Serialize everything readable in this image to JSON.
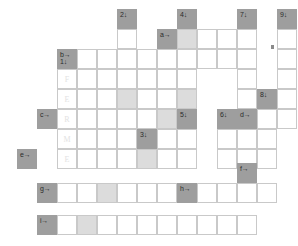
{
  "puzzle": {
    "type": "crossword-grid",
    "title": "",
    "cell_size": 20,
    "colors": {
      "clue_cell": "#9e9e9e",
      "shaded_cell": "#dcdcdc",
      "empty_cell": "#ffffff",
      "grid_line": "#c9c9c9",
      "letter_color": "#e2e2e2",
      "label_color": "#2b2b2b"
    },
    "across_markers": [
      "a→",
      "b→",
      "c→",
      "d→",
      "e→",
      "f→",
      "g→",
      "h→",
      "i→"
    ],
    "down_markers": [
      "1↓",
      "2↓",
      "3↓",
      "4↓",
      "5↓",
      "6↓",
      "7↓",
      "8↓",
      "9↓"
    ],
    "prefilled_word": "FERME",
    "cells": [
      {
        "id": "c-2d",
        "x": 117,
        "y": 9,
        "kind": "clue",
        "labels": [
          "2↓"
        ]
      },
      {
        "id": "c-4d",
        "x": 177,
        "y": 9,
        "kind": "clue",
        "labels": [
          "4↓"
        ]
      },
      {
        "id": "c-7d",
        "x": 237,
        "y": 9,
        "kind": "clue",
        "labels": [
          "7↓"
        ]
      },
      {
        "id": "c-9d",
        "x": 277,
        "y": 9,
        "kind": "clue",
        "labels": [
          "9↓"
        ]
      },
      {
        "id": "r1c2",
        "x": 117,
        "y": 29,
        "kind": "empty",
        "labels": []
      },
      {
        "id": "c-ar",
        "x": 157,
        "y": 29,
        "kind": "clue",
        "labels": [
          "a→"
        ]
      },
      {
        "id": "r1c4",
        "x": 177,
        "y": 29,
        "kind": "shade",
        "labels": []
      },
      {
        "id": "r1c5",
        "x": 197,
        "y": 29,
        "kind": "empty",
        "labels": []
      },
      {
        "id": "r1c6",
        "x": 217,
        "y": 29,
        "kind": "empty",
        "labels": []
      },
      {
        "id": "r1c7",
        "x": 237,
        "y": 29,
        "kind": "empty",
        "labels": []
      },
      {
        "id": "r1c9",
        "x": 277,
        "y": 29,
        "kind": "empty",
        "labels": []
      },
      {
        "id": "c-b1",
        "x": 57,
        "y": 49,
        "kind": "clue",
        "labels": [
          "b→",
          "1↓"
        ]
      },
      {
        "id": "r2c1",
        "x": 77,
        "y": 49,
        "kind": "empty",
        "labels": []
      },
      {
        "id": "r2c2",
        "x": 97,
        "y": 49,
        "kind": "empty",
        "labels": []
      },
      {
        "id": "r2c3",
        "x": 117,
        "y": 49,
        "kind": "empty",
        "labels": []
      },
      {
        "id": "r2c4",
        "x": 137,
        "y": 49,
        "kind": "empty",
        "labels": []
      },
      {
        "id": "r2c5",
        "x": 157,
        "y": 49,
        "kind": "empty",
        "labels": []
      },
      {
        "id": "r2c6",
        "x": 177,
        "y": 49,
        "kind": "empty",
        "labels": []
      },
      {
        "id": "r2c7",
        "x": 197,
        "y": 49,
        "kind": "empty",
        "labels": []
      },
      {
        "id": "r2c8",
        "x": 217,
        "y": 49,
        "kind": "empty",
        "labels": []
      },
      {
        "id": "r2c9",
        "x": 237,
        "y": 49,
        "kind": "empty",
        "labels": []
      },
      {
        "id": "r2c11",
        "x": 277,
        "y": 49,
        "kind": "empty",
        "labels": []
      },
      {
        "id": "r3c0",
        "x": 57,
        "y": 69,
        "kind": "empty",
        "labels": [],
        "letter": "F"
      },
      {
        "id": "r3c1",
        "x": 77,
        "y": 69,
        "kind": "empty",
        "labels": []
      },
      {
        "id": "r3c2",
        "x": 97,
        "y": 69,
        "kind": "empty",
        "labels": []
      },
      {
        "id": "r3c3",
        "x": 117,
        "y": 69,
        "kind": "empty",
        "labels": []
      },
      {
        "id": "r3c4",
        "x": 137,
        "y": 69,
        "kind": "empty",
        "labels": []
      },
      {
        "id": "r3c5",
        "x": 157,
        "y": 69,
        "kind": "empty",
        "labels": []
      },
      {
        "id": "r3c6",
        "x": 177,
        "y": 69,
        "kind": "empty",
        "labels": []
      },
      {
        "id": "r3c7",
        "x": 237,
        "y": 69,
        "kind": "empty",
        "labels": []
      },
      {
        "id": "r3c11",
        "x": 277,
        "y": 69,
        "kind": "empty",
        "labels": []
      },
      {
        "id": "r4c0",
        "x": 57,
        "y": 89,
        "kind": "empty",
        "labels": [],
        "letter": "E"
      },
      {
        "id": "r4c1",
        "x": 77,
        "y": 89,
        "kind": "empty",
        "labels": []
      },
      {
        "id": "r4c2",
        "x": 97,
        "y": 89,
        "kind": "empty",
        "labels": []
      },
      {
        "id": "r4c3",
        "x": 117,
        "y": 89,
        "kind": "shade",
        "labels": []
      },
      {
        "id": "r4c4",
        "x": 137,
        "y": 89,
        "kind": "empty",
        "labels": []
      },
      {
        "id": "r4c5",
        "x": 157,
        "y": 89,
        "kind": "empty",
        "labels": []
      },
      {
        "id": "r4c6",
        "x": 177,
        "y": 89,
        "kind": "shade",
        "labels": []
      },
      {
        "id": "r4c7",
        "x": 237,
        "y": 89,
        "kind": "empty",
        "labels": []
      },
      {
        "id": "c-8d",
        "x": 257,
        "y": 89,
        "kind": "clue",
        "labels": [
          "8↓"
        ]
      },
      {
        "id": "r4c11",
        "x": 277,
        "y": 89,
        "kind": "empty",
        "labels": []
      },
      {
        "id": "c-cr",
        "x": 37,
        "y": 109,
        "kind": "clue",
        "labels": [
          "c→"
        ]
      },
      {
        "id": "r5c0",
        "x": 57,
        "y": 109,
        "kind": "empty",
        "labels": [],
        "letter": "R"
      },
      {
        "id": "r5c1",
        "x": 77,
        "y": 109,
        "kind": "empty",
        "labels": []
      },
      {
        "id": "r5c2",
        "x": 97,
        "y": 109,
        "kind": "empty",
        "labels": []
      },
      {
        "id": "r5c3",
        "x": 117,
        "y": 109,
        "kind": "empty",
        "labels": []
      },
      {
        "id": "r5c4",
        "x": 137,
        "y": 109,
        "kind": "empty",
        "labels": []
      },
      {
        "id": "r5c5",
        "x": 157,
        "y": 109,
        "kind": "shade",
        "labels": []
      },
      {
        "id": "c-5d",
        "x": 177,
        "y": 109,
        "kind": "clue",
        "labels": [
          "5↓"
        ]
      },
      {
        "id": "c-6d",
        "x": 217,
        "y": 109,
        "kind": "clue",
        "labels": [
          "6↓"
        ]
      },
      {
        "id": "c-dr",
        "x": 237,
        "y": 109,
        "kind": "clue",
        "labels": [
          "d→"
        ]
      },
      {
        "id": "r5c10",
        "x": 257,
        "y": 109,
        "kind": "empty",
        "labels": []
      },
      {
        "id": "r5c11",
        "x": 277,
        "y": 109,
        "kind": "empty",
        "labels": []
      },
      {
        "id": "r6c0",
        "x": 57,
        "y": 129,
        "kind": "empty",
        "labels": [],
        "letter": "M"
      },
      {
        "id": "r6c1",
        "x": 77,
        "y": 129,
        "kind": "empty",
        "labels": []
      },
      {
        "id": "r6c2",
        "x": 97,
        "y": 129,
        "kind": "empty",
        "labels": []
      },
      {
        "id": "r6c3",
        "x": 117,
        "y": 129,
        "kind": "empty",
        "labels": []
      },
      {
        "id": "c-3d",
        "x": 137,
        "y": 129,
        "kind": "clue",
        "labels": [
          "3↓"
        ]
      },
      {
        "id": "r6c5",
        "x": 157,
        "y": 129,
        "kind": "empty",
        "labels": []
      },
      {
        "id": "r6c6",
        "x": 177,
        "y": 129,
        "kind": "empty",
        "labels": []
      },
      {
        "id": "r6c7",
        "x": 217,
        "y": 129,
        "kind": "empty",
        "labels": []
      },
      {
        "id": "r6c8",
        "x": 237,
        "y": 129,
        "kind": "empty",
        "labels": []
      },
      {
        "id": "r6c9",
        "x": 257,
        "y": 129,
        "kind": "empty",
        "labels": []
      },
      {
        "id": "c-er",
        "x": 17,
        "y": 149,
        "kind": "clue",
        "labels": [
          "e→"
        ]
      },
      {
        "id": "r7c0",
        "x": 57,
        "y": 149,
        "kind": "empty",
        "labels": [],
        "letter": "E"
      },
      {
        "id": "r7c1",
        "x": 77,
        "y": 149,
        "kind": "empty",
        "labels": []
      },
      {
        "id": "r7c2",
        "x": 97,
        "y": 149,
        "kind": "empty",
        "labels": []
      },
      {
        "id": "r7c3",
        "x": 117,
        "y": 149,
        "kind": "empty",
        "labels": []
      },
      {
        "id": "r7c4",
        "x": 137,
        "y": 149,
        "kind": "shade",
        "labels": []
      },
      {
        "id": "r7c5",
        "x": 157,
        "y": 149,
        "kind": "empty",
        "labels": []
      },
      {
        "id": "r7c6",
        "x": 177,
        "y": 149,
        "kind": "empty",
        "labels": []
      },
      {
        "id": "r7c7",
        "x": 217,
        "y": 149,
        "kind": "empty",
        "labels": []
      },
      {
        "id": "r7c8",
        "x": 237,
        "y": 149,
        "kind": "empty",
        "labels": []
      },
      {
        "id": "r7c9",
        "x": 257,
        "y": 149,
        "kind": "empty",
        "labels": []
      },
      {
        "id": "c-fr",
        "x": 237,
        "y": 163,
        "kind": "clue",
        "labels": [
          "f→"
        ]
      },
      {
        "id": "c-gr",
        "x": 37,
        "y": 183,
        "kind": "clue",
        "labels": [
          "g→"
        ]
      },
      {
        "id": "r9c1",
        "x": 57,
        "y": 183,
        "kind": "empty",
        "labels": []
      },
      {
        "id": "r9c2",
        "x": 77,
        "y": 183,
        "kind": "empty",
        "labels": []
      },
      {
        "id": "r9c3",
        "x": 97,
        "y": 183,
        "kind": "shade",
        "labels": []
      },
      {
        "id": "r9c4",
        "x": 117,
        "y": 183,
        "kind": "empty",
        "labels": []
      },
      {
        "id": "r9c5",
        "x": 137,
        "y": 183,
        "kind": "empty",
        "labels": []
      },
      {
        "id": "r9c6",
        "x": 157,
        "y": 183,
        "kind": "empty",
        "labels": []
      },
      {
        "id": "c-hr",
        "x": 177,
        "y": 183,
        "kind": "clue",
        "labels": [
          "h→"
        ]
      },
      {
        "id": "r9c8",
        "x": 197,
        "y": 183,
        "kind": "empty",
        "labels": []
      },
      {
        "id": "r9c9",
        "x": 217,
        "y": 183,
        "kind": "empty",
        "labels": []
      },
      {
        "id": "r9c10",
        "x": 237,
        "y": 183,
        "kind": "empty",
        "labels": []
      },
      {
        "id": "r9c11",
        "x": 257,
        "y": 183,
        "kind": "empty",
        "labels": []
      },
      {
        "id": "c-ir",
        "x": 37,
        "y": 215,
        "kind": "clue",
        "labels": [
          "i→"
        ]
      },
      {
        "id": "r10c1",
        "x": 57,
        "y": 215,
        "kind": "empty",
        "labels": []
      },
      {
        "id": "r10c2",
        "x": 77,
        "y": 215,
        "kind": "shade",
        "labels": []
      },
      {
        "id": "r10c3",
        "x": 97,
        "y": 215,
        "kind": "empty",
        "labels": []
      },
      {
        "id": "r10c4",
        "x": 117,
        "y": 215,
        "kind": "empty",
        "labels": []
      },
      {
        "id": "r10c5",
        "x": 137,
        "y": 215,
        "kind": "empty",
        "labels": []
      },
      {
        "id": "r10c6",
        "x": 157,
        "y": 215,
        "kind": "empty",
        "labels": []
      },
      {
        "id": "r10c7",
        "x": 177,
        "y": 215,
        "kind": "empty",
        "labels": []
      },
      {
        "id": "r10c8",
        "x": 197,
        "y": 215,
        "kind": "empty",
        "labels": []
      },
      {
        "id": "r10c9",
        "x": 217,
        "y": 215,
        "kind": "empty",
        "labels": []
      },
      {
        "id": "r10c10",
        "x": 237,
        "y": 215,
        "kind": "empty",
        "labels": []
      }
    ],
    "ticks": [
      {
        "x": 271,
        "y": 45
      },
      {
        "x": 271,
        "y": 46
      }
    ]
  }
}
